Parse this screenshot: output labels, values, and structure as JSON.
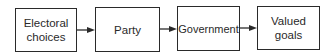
{
  "diagram": {
    "type": "flowchart",
    "direction": "left-to-right",
    "nodes": [
      {
        "id": "electoral-choices",
        "label": "Electoral\nchoices"
      },
      {
        "id": "party",
        "label": "Party"
      },
      {
        "id": "government",
        "label": "Government"
      },
      {
        "id": "valued-goals",
        "label": "Valued\ngoals"
      }
    ],
    "edges": [
      {
        "from": "electoral-choices",
        "to": "party"
      },
      {
        "from": "party",
        "to": "government"
      },
      {
        "from": "government",
        "to": "valued-goals"
      }
    ],
    "colors": {
      "stroke": "#2a2a2a",
      "background": "#ffffff"
    }
  }
}
